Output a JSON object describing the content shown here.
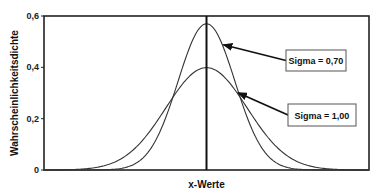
{
  "chart_data": {
    "type": "line",
    "title": "",
    "xlabel": "x-Werte",
    "ylabel": "Wahrscheinlichkeitsdichte",
    "xlim": [
      -4,
      4
    ],
    "ylim": [
      0,
      0.6
    ],
    "yticks": [
      {
        "value": 0,
        "label": "0"
      },
      {
        "value": 0.2,
        "label": "0,2"
      },
      {
        "value": 0.4,
        "label": "0,4"
      },
      {
        "value": 0.6,
        "label": "0,6"
      }
    ],
    "grid": false,
    "mean_line": {
      "x": 0
    },
    "series": [
      {
        "name": "Sigma = 0,70",
        "distribution": "normal",
        "mean": 0,
        "sigma": 0.7,
        "peak": 0.57
      },
      {
        "name": "Sigma = 1,00",
        "distribution": "normal",
        "mean": 0,
        "sigma": 1.0,
        "peak": 0.4
      }
    ],
    "annotations": [
      {
        "text": "Sigma = 0,70",
        "series": 0,
        "points_to_x": 0.39
      },
      {
        "text": "Sigma = 1,00",
        "series": 1,
        "points_to_x": 0.75
      }
    ]
  }
}
